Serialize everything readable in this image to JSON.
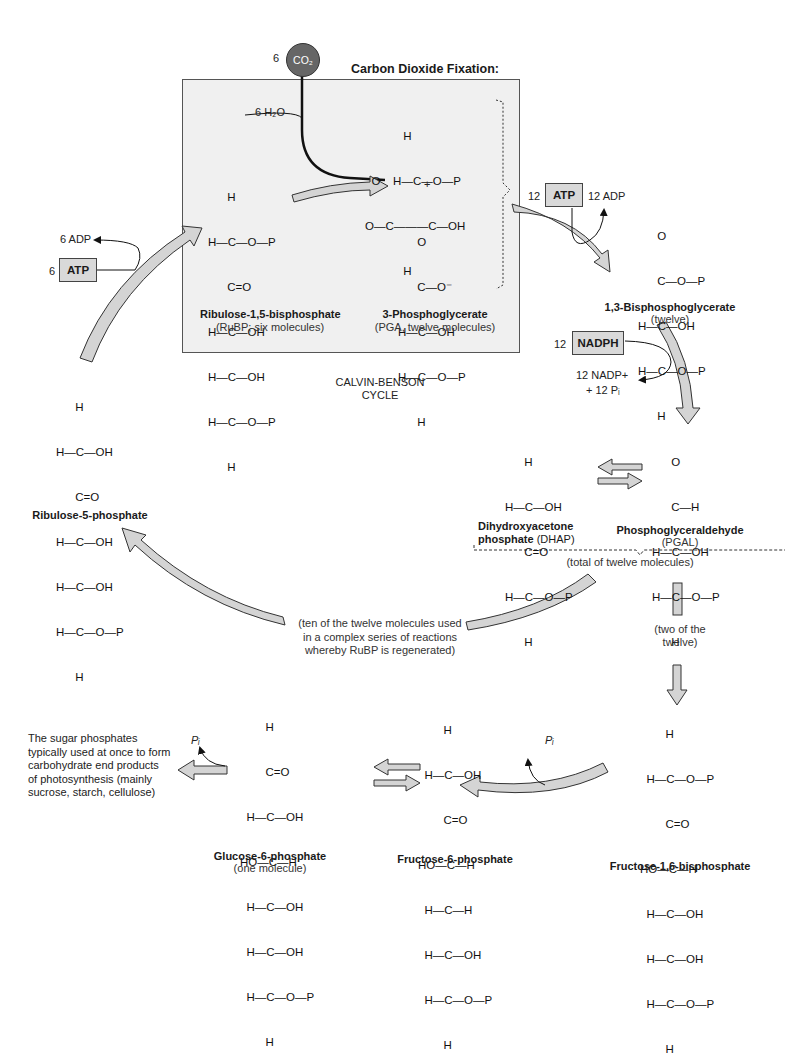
{
  "figure": {
    "fixation_title": "Carbon Dioxide Fixation:",
    "cycle_label_line1": "CALVIN-BENSON",
    "cycle_label_line2": "CYCLE",
    "co2": {
      "coefficient": "6",
      "label": "CO₂"
    },
    "water": "6 H₂O",
    "plus": "+"
  },
  "inputs": {
    "atp_left": {
      "coefficient": "6",
      "label": "ATP",
      "product": "6 ADP"
    },
    "atp_right": {
      "coefficient": "12",
      "label": "ATP",
      "product": "12 ADP"
    },
    "nadph": {
      "coefficient": "12",
      "label": "NADPH",
      "product_line1": "12 NADP+",
      "product_line2": "+ 12 Pᵢ"
    },
    "pi_f16bp": "Pᵢ",
    "pi_g6p": "Pᵢ"
  },
  "molecules": {
    "rubp": {
      "name": "Ribulose-1,5-bisphosphate",
      "note": "(RuBP; six molecules)",
      "rows": [
        "      H",
        "H—C—O—P",
        "      C=O",
        "H—C—OH",
        "H—C—OH",
        "H—C—O—P",
        "      H"
      ]
    },
    "pga_upper": {
      "rows": [
        "            H",
        "  O    H—C—O—P",
        "O—C———C—OH",
        "            H"
      ]
    },
    "pga": {
      "name": "3-Phosphoglycerate",
      "note": "(PGA, twelve molecules)",
      "rows": [
        "      O",
        "      C—O⁻",
        "H—C—OH",
        "H—C—O—P",
        "      H"
      ]
    },
    "bpg": {
      "name": "1,3-Bisphosphoglycerate",
      "note": "(twelve)",
      "rows": [
        "      O",
        "      C—O—P",
        "H—C—OH",
        "H—C—O—P",
        "      H"
      ]
    },
    "pgal": {
      "name": "Phosphoglyceraldehyde",
      "note": "(PGAL)",
      "rows": [
        "      O",
        "      C—H",
        "H—C—OH",
        "H—C—O—P",
        "      H"
      ]
    },
    "dhap": {
      "name_line1": "Dihydroxyacetone",
      "name_line2": "phosphate",
      "abbr": "(DHAP)",
      "rows": [
        "      H",
        "H—C—OH",
        "      C=O",
        "H—C—O—P",
        "      H"
      ]
    },
    "ru5p": {
      "name": "Ribulose-5-phosphate",
      "rows": [
        "      H",
        "H—C—OH",
        "      C=O",
        "H—C—OH",
        "H—C—OH",
        "H—C—O—P",
        "      H"
      ]
    },
    "f16bp": {
      "name": "Fructose-1,6-bisphosphate",
      "rows": [
        "        H",
        "  H—C—O—P",
        "        C=O",
        "HO—C—H",
        "  H—C—OH",
        "  H—C—OH",
        "  H—C—O—P",
        "        H"
      ]
    },
    "f6p": {
      "name": "Fructose-6-phosphate",
      "rows": [
        "        H",
        "  H—C—OH",
        "        C=O",
        "HO—C—H",
        "  H—C—H",
        "  H—C—OH",
        "  H—C—O—P",
        "        H"
      ]
    },
    "g6p": {
      "name": "Glucose-6-phosphate",
      "note": "(one molecule)",
      "rows": [
        "        H",
        "        C=O",
        "  H—C—OH",
        "HO—C—H",
        "  H—C—OH",
        "  H—C—OH",
        "  H—C—O—P",
        "        H"
      ]
    }
  },
  "annotations": {
    "total": "(total of twelve molecules)",
    "two_of_twelve_line1": "(two of the",
    "two_of_twelve_line2": "twelve)",
    "ten_line1": "(ten of the twelve molecules used",
    "ten_line2": "in a complex series of reactions",
    "ten_line3": "whereby RuBP is regenerated)",
    "end_products": [
      "The sugar phosphates",
      "typically used at once to form",
      "carbohydrate end products",
      "of photosynthesis (mainly",
      "sucrose, starch, cellulose)"
    ]
  },
  "colors": {
    "box_fill": "#f0f0f0",
    "arrow_fill": "#d4d4d4",
    "co2_fill": "#666666",
    "chip_fill": "#d9d9d9"
  }
}
